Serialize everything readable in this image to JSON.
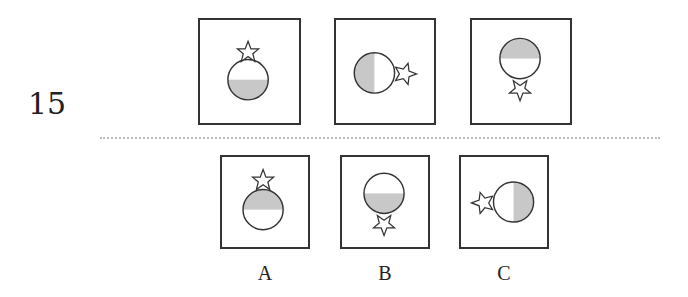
{
  "question": {
    "number": "15"
  },
  "colors": {
    "shade": "#c8c8c8",
    "stroke": "#333333",
    "divider": "#bbbbbb"
  },
  "sequence": [
    {
      "id": "seq-1",
      "shaded_half": "bottom",
      "star_position": "top"
    },
    {
      "id": "seq-2",
      "shaded_half": "left",
      "star_position": "right"
    },
    {
      "id": "seq-3",
      "shaded_half": "top",
      "star_position": "bottom"
    }
  ],
  "options": [
    {
      "id": "A",
      "label": "A",
      "shaded_half": "top",
      "star_position": "top"
    },
    {
      "id": "B",
      "label": "B",
      "shaded_half": "bottom",
      "star_position": "bottom"
    },
    {
      "id": "C",
      "label": "C",
      "shaded_half": "right",
      "star_position": "left"
    }
  ]
}
